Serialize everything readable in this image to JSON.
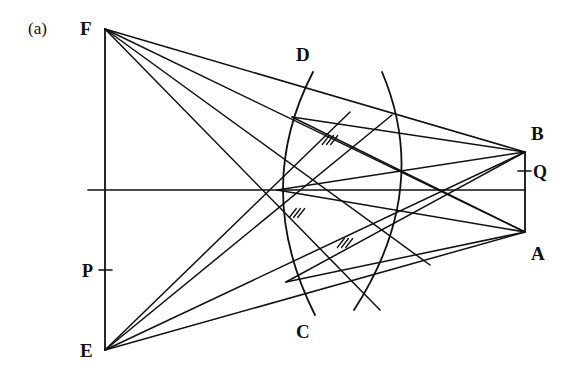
{
  "figure": {
    "panel_label": "(a)",
    "background_color": "#ffffff",
    "stroke_color": "#101010",
    "width": 579,
    "height": 384
  },
  "points": {
    "F": {
      "label": "F",
      "x": 105,
      "y": 29,
      "label_x": 80,
      "label_y": 19
    },
    "E": {
      "label": "E",
      "x": 105,
      "y": 350,
      "label_x": 80,
      "label_y": 341
    },
    "B": {
      "label": "B",
      "x": 525,
      "y": 152,
      "label_x": 531,
      "label_y": 124
    },
    "A": {
      "label": "A",
      "x": 525,
      "y": 232,
      "label_x": 531,
      "label_y": 244
    },
    "D": {
      "label": "D",
      "x": 313,
      "y": 72,
      "label_x": 296,
      "label_y": 45
    },
    "C": {
      "label": "C",
      "x": 315,
      "y": 315,
      "label_x": 296,
      "label_y": 322
    },
    "P": {
      "label": "P",
      "x": 105,
      "y": 270,
      "label_x": 82,
      "label_y": 262
    },
    "Q": {
      "label": "Q",
      "x": 525,
      "y": 171,
      "label_x": 533,
      "label_y": 163
    }
  },
  "nodes": {
    "left_hub": {
      "x": 277,
      "y": 190
    },
    "right_hub": {
      "x": 408,
      "y": 190
    }
  },
  "axis": {
    "name": "horizontal-axis",
    "x1": 88,
    "y1": 190,
    "x2": 525,
    "y2": 190
  },
  "vertical_edges": [
    {
      "name": "edge-FE",
      "x1": 105,
      "y1": 29,
      "x2": 105,
      "y2": 350
    },
    {
      "name": "edge-BA",
      "x1": 525,
      "y1": 152,
      "x2": 525,
      "y2": 232
    }
  ],
  "ticks": [
    {
      "name": "tick-P",
      "x1": 99,
      "y1": 270,
      "x2": 112,
      "y2": 270
    },
    {
      "name": "tick-Q",
      "x1": 518,
      "y1": 171,
      "x2": 531,
      "y2": 171
    }
  ],
  "rays": [
    {
      "name": "ray-F-B",
      "x1": 105,
      "y1": 29,
      "x2": 525,
      "y2": 152
    },
    {
      "name": "ray-F-A",
      "x1": 105,
      "y1": 29,
      "x2": 525,
      "y2": 232
    },
    {
      "name": "ray-F-node",
      "x1": 105,
      "y1": 29,
      "x2": 430,
      "y2": 265
    },
    {
      "name": "ray-F-low",
      "x1": 105,
      "y1": 29,
      "x2": 380,
      "y2": 310
    },
    {
      "name": "ray-E-B",
      "x1": 105,
      "y1": 350,
      "x2": 525,
      "y2": 152
    },
    {
      "name": "ray-E-A",
      "x1": 105,
      "y1": 350,
      "x2": 525,
      "y2": 232
    },
    {
      "name": "ray-E-up",
      "x1": 105,
      "y1": 350,
      "x2": 392,
      "y2": 115
    },
    {
      "name": "ray-E-top",
      "x1": 105,
      "y1": 350,
      "x2": 350,
      "y2": 112
    }
  ],
  "chords": [
    {
      "name": "chord-B-left-hub",
      "x1": 525,
      "y1": 152,
      "x2": 277,
      "y2": 190
    },
    {
      "name": "chord-A-left-hub",
      "x1": 525,
      "y1": 232,
      "x2": 277,
      "y2": 190
    },
    {
      "name": "chord-B-lower",
      "x1": 525,
      "y1": 152,
      "x2": 286,
      "y2": 282
    },
    {
      "name": "chord-A-upper",
      "x1": 525,
      "y1": 232,
      "x2": 292,
      "y2": 117
    },
    {
      "name": "chord-top-span",
      "x1": 292,
      "y1": 117,
      "x2": 525,
      "y2": 152
    },
    {
      "name": "chord-bottom-span",
      "x1": 286,
      "y1": 282,
      "x2": 525,
      "y2": 232
    }
  ],
  "arcs": [
    {
      "name": "arc-DC",
      "x1": 313,
      "y1": 72,
      "cx": 252,
      "cy": 190,
      "x2": 315,
      "y2": 315
    },
    {
      "name": "arc-right",
      "x1": 382,
      "y1": 72,
      "cx": 432,
      "cy": 190,
      "x2": 354,
      "y2": 310
    }
  ],
  "hatch_marks": [
    {
      "name": "hatch-upper",
      "x": 330,
      "y": 140,
      "strokes": 3
    },
    {
      "name": "hatch-middle",
      "x": 297,
      "y": 213,
      "strokes": 3
    },
    {
      "name": "hatch-lower",
      "x": 345,
      "y": 243,
      "strokes": 3
    }
  ]
}
